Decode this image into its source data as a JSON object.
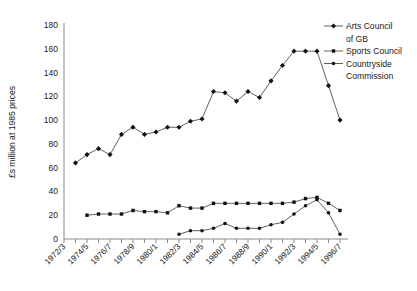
{
  "chart_data": {
    "type": "line",
    "title": "",
    "xlabel": "",
    "ylabel": "£s million at 1985 prices",
    "ylim": [
      0,
      180
    ],
    "ytick_step": 20,
    "ytick_labels": [
      "0",
      "20",
      "40",
      "60",
      "80",
      "100",
      "120",
      "140",
      "160",
      "180"
    ],
    "grid": false,
    "legend_position": "right",
    "x": [
      "1972/3",
      "1973/4",
      "1974/5",
      "1975/6",
      "1976/7",
      "1977/8",
      "1978/9",
      "1979/80",
      "1980/1",
      "1981/2",
      "1982/3",
      "1983/4",
      "1984/5",
      "1985/6",
      "1986/7",
      "1987/8",
      "1988/9",
      "1989/90",
      "1990/1",
      "1991/2",
      "1992/3",
      "1993/4",
      "1994/5",
      "1995/6",
      "1996/7"
    ],
    "xtick_labels": [
      "1972/3",
      "1974/5",
      "1976/7",
      "1978/9",
      "1980/1",
      "1982/3",
      "1984/5",
      "1986/7",
      "1988/9",
      "1990/1",
      "1992/3",
      "1994/5",
      "1996/7"
    ],
    "series": [
      {
        "name": "Arts Council of GB",
        "marker": "diamond",
        "values": [
          null,
          64,
          71,
          76,
          71,
          88,
          94,
          88,
          90,
          94,
          94,
          99,
          101,
          124,
          123,
          116,
          124,
          119,
          133,
          146,
          158,
          158,
          158,
          129,
          100
        ]
      },
      {
        "name": "Sports Council",
        "marker": "square",
        "values": [
          null,
          null,
          20,
          21,
          21,
          21,
          24,
          23,
          23,
          22,
          28,
          26,
          26,
          30,
          30,
          30,
          30,
          30,
          30,
          30,
          31,
          34,
          35,
          30,
          24
        ]
      },
      {
        "name": "Countryside Commission",
        "marker": "circle",
        "values": [
          null,
          null,
          null,
          null,
          null,
          null,
          null,
          null,
          null,
          null,
          4,
          7,
          7,
          9,
          13,
          9,
          9,
          9,
          12,
          14,
          21,
          28,
          33,
          22,
          4
        ]
      }
    ]
  },
  "legend": {
    "entries": [
      {
        "line1": "Arts Council",
        "line2": "of GB"
      },
      {
        "line1": "Sports Council",
        "line2": ""
      },
      {
        "line1": "Countryside",
        "line2": "Commission"
      }
    ]
  }
}
